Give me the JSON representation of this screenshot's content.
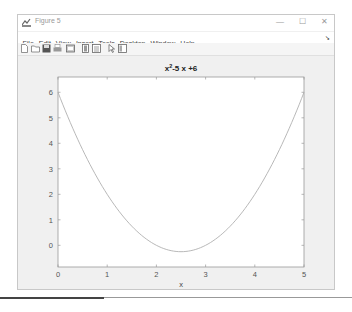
{
  "window": {
    "title": "Figure 5",
    "controls": {
      "minimize": "—",
      "maximize": "☐",
      "close": "✕"
    }
  },
  "menu": {
    "items": [
      {
        "label": "File"
      },
      {
        "label": "Edit"
      },
      {
        "label": "View"
      },
      {
        "label": "Insert"
      },
      {
        "label": "Tools"
      },
      {
        "label": "Desktop"
      },
      {
        "label": "Window"
      },
      {
        "label": "Help"
      }
    ],
    "dock_glyph": "➘"
  },
  "toolbar": {
    "icons": [
      "new-figure-icon",
      "open-file-icon",
      "save-icon",
      "print-icon",
      "link-plot-icon",
      "insert-colorbar-icon",
      "insert-legend-icon",
      "edit-plot-arrow-icon",
      "property-inspector-icon"
    ]
  },
  "chart_data": {
    "type": "line",
    "title_parts": {
      "base": "x",
      "sup": "2",
      "rest": "-5 x +6"
    },
    "xlabel": "x",
    "ylabel": "",
    "xlim": [
      0,
      5
    ],
    "ylim": [
      -0.85,
      6.6
    ],
    "xticks": [
      0,
      1,
      2,
      3,
      4,
      5
    ],
    "yticks": [
      0,
      1,
      2,
      3,
      4,
      5,
      6
    ],
    "grid": false,
    "legend": null,
    "line_color": "#b0b0b0",
    "series": [
      {
        "name": "x^2-5x+6",
        "x": [
          0,
          0.25,
          0.5,
          0.75,
          1,
          1.25,
          1.5,
          1.75,
          2,
          2.25,
          2.5,
          2.75,
          3,
          3.25,
          3.5,
          3.75,
          4,
          4.25,
          4.5,
          4.75,
          5
        ],
        "y": [
          6,
          4.8125,
          3.75,
          2.8125,
          2,
          1.3125,
          0.75,
          0.3125,
          0,
          -0.1875,
          -0.25,
          -0.1875,
          0,
          0.3125,
          0.75,
          1.3125,
          2,
          2.8125,
          3.75,
          4.8125,
          6
        ]
      }
    ]
  }
}
